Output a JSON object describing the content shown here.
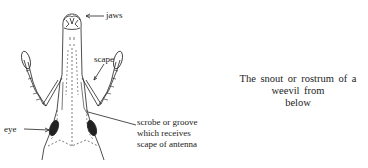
{
  "figure": {
    "caption": "The snout or rostrum of a weevil from below",
    "caption_line1": "The snout or rostrum of a weevil from",
    "caption_line2": "below",
    "labels": {
      "jaws": "jaws",
      "scape": "scape",
      "eye": "eye",
      "scrobe_line1": "scrobe or groove",
      "scrobe_line2": "which receives",
      "scrobe_line3": "scape of antenna"
    },
    "colors": {
      "ink": "#222222",
      "background": "#ffffff"
    }
  }
}
